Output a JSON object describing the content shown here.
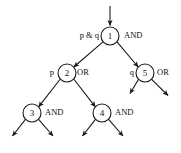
{
  "diagram": {
    "type": "and-or-tree",
    "canvas": {
      "width": 181,
      "height": 153
    },
    "root_entry_arrow": {
      "present": true,
      "direction": "down"
    },
    "nodes": [
      {
        "id": "1",
        "number": "1",
        "left_label": "p & q",
        "right_label": "AND",
        "cx": 110,
        "cy": 36,
        "r": 9
      },
      {
        "id": "2",
        "number": "2",
        "left_label": "p",
        "right_label": "OR",
        "cx": 67,
        "cy": 73,
        "r": 9
      },
      {
        "id": "5",
        "number": "5",
        "left_label": "q",
        "right_label": "OR",
        "cx": 145,
        "cy": 73,
        "r": 9
      },
      {
        "id": "3",
        "number": "3",
        "left_label": "",
        "right_label": "AND",
        "cx": 32,
        "cy": 113,
        "r": 9
      },
      {
        "id": "4",
        "number": "4",
        "left_label": "",
        "right_label": "AND",
        "cx": 102,
        "cy": 113,
        "r": 9
      }
    ],
    "edges": [
      {
        "from": "1",
        "to": "2",
        "label": ""
      },
      {
        "from": "1",
        "to": "5",
        "label": ""
      },
      {
        "from": "2",
        "to": "3",
        "label": ""
      },
      {
        "from": "2",
        "to": "4",
        "label": ""
      }
    ],
    "dangling_arrows": [
      {
        "from": "5",
        "side": "left"
      },
      {
        "from": "5",
        "side": "right"
      },
      {
        "from": "3",
        "side": "left"
      },
      {
        "from": "3",
        "side": "right"
      },
      {
        "from": "4",
        "side": "left"
      },
      {
        "from": "4",
        "side": "right"
      }
    ],
    "colors": {
      "stroke": "#1a1a1a",
      "text": "#111111",
      "node_fill": "#ffffff",
      "background": "#ffffff"
    }
  }
}
